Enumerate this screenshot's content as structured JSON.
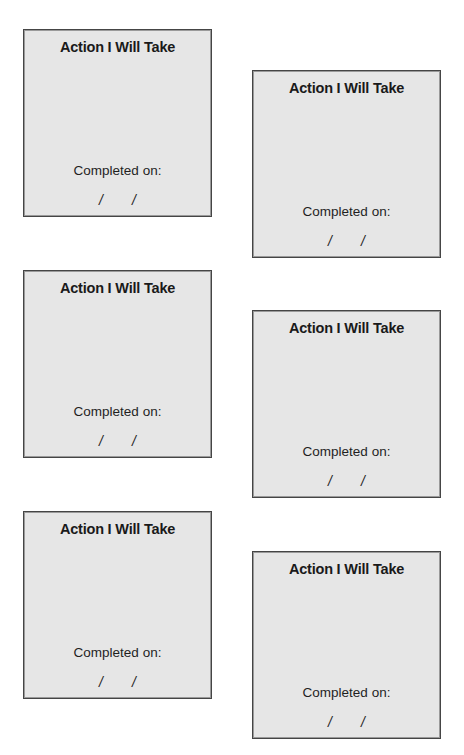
{
  "cards": [
    {
      "title": "Action I Will Take",
      "completed_label": "Completed on:",
      "date_sep1": "/",
      "date_sep2": "/"
    },
    {
      "title": "Action I Will Take",
      "completed_label": "Completed on:",
      "date_sep1": "/",
      "date_sep2": "/"
    },
    {
      "title": "Action I Will Take",
      "completed_label": "Completed on:",
      "date_sep1": "/",
      "date_sep2": "/"
    },
    {
      "title": "Action I Will Take",
      "completed_label": "Completed on:",
      "date_sep1": "/",
      "date_sep2": "/"
    },
    {
      "title": "Action I Will Take",
      "completed_label": "Completed on:",
      "date_sep1": "/",
      "date_sep2": "/"
    },
    {
      "title": "Action I Will Take",
      "completed_label": "Completed on:",
      "date_sep1": "/",
      "date_sep2": "/"
    }
  ],
  "colors": {
    "card_bg": "#e6e6e6",
    "card_border": "#454545",
    "text": "#1a1a1a"
  }
}
